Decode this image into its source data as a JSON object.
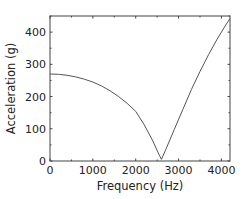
{
  "chart_data": {
    "type": "line",
    "title": "",
    "xlabel": "Frequency (Hz)",
    "ylabel": "Acceleration (g)",
    "xlim": [
      0,
      4200
    ],
    "ylim": [
      0,
      450
    ],
    "xticks": [
      0,
      1000,
      2000,
      3000,
      4000
    ],
    "yticks": [
      0,
      100,
      200,
      300,
      400
    ],
    "xtick_labels": [
      "0",
      "1000",
      "2000",
      "3000",
      "4000"
    ],
    "ytick_labels": [
      "0",
      "100",
      "200",
      "300",
      "400"
    ],
    "grid": false,
    "legend": null,
    "series": [
      {
        "name": "Acceleration",
        "color": "#555555",
        "x": [
          0,
          200,
          400,
          600,
          800,
          1000,
          1200,
          1400,
          1600,
          1800,
          2000,
          2200,
          2400,
          2550,
          2600,
          2700,
          2900,
          3100,
          3300,
          3500,
          3700,
          3900,
          4100,
          4200
        ],
        "y": [
          270,
          269,
          266,
          261,
          254,
          245,
          233,
          218,
          200,
          179,
          154,
          112,
          62,
          18,
          5,
          35,
          98,
          160,
          222,
          278,
          330,
          378,
          422,
          442
        ]
      }
    ]
  }
}
